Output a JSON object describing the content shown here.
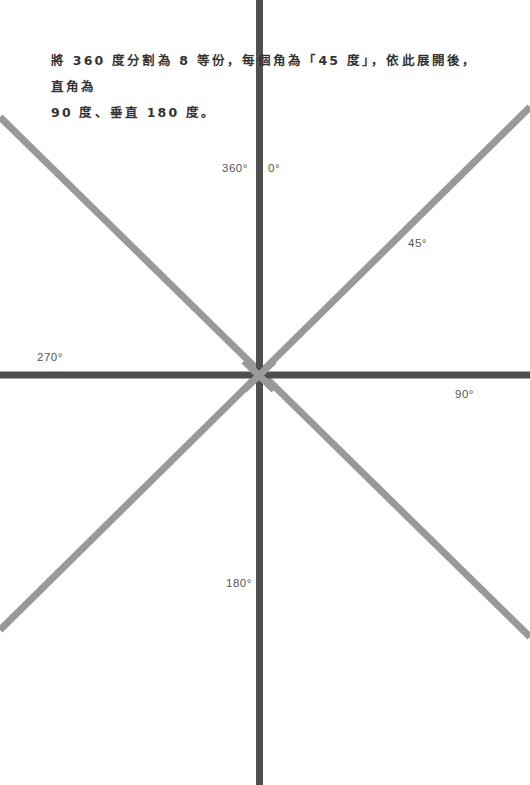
{
  "caption": {
    "line1": "將 360 度分割為 8 等份，每個角為「45 度」，依此展開後，直角為",
    "line2": "90 度、垂直 180 度。"
  },
  "labels": {
    "deg360": "360°",
    "deg0": "0°",
    "deg45": "45°",
    "deg90": "90°",
    "deg180": "180°",
    "deg270": "270°"
  },
  "colors": {
    "axis": "#4f4f4f",
    "diagonal": "#999999",
    "text": "#333333"
  },
  "geometry": {
    "center": [
      259,
      375
    ],
    "diagonals": [
      {
        "from": [
          0,
          117
        ],
        "to": [
          530,
          637
        ]
      },
      {
        "from": [
          0,
          630
        ],
        "to": [
          530,
          107
        ]
      }
    ]
  }
}
